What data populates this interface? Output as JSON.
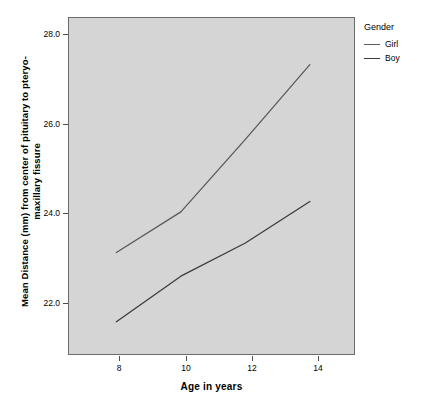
{
  "chart_data": {
    "type": "line",
    "title": "",
    "xlabel": "Age in years",
    "ylabel": "Mean Distance (mm) from center of pituitary to pteryo-maxillary fissure",
    "ylabel_line1": "Mean Distance (mm) from center of pituitary to pteryo-",
    "ylabel_line2": "maxillary fissure",
    "x": [
      8,
      10,
      12,
      14
    ],
    "xtick_labels": [
      "8",
      "10",
      "12",
      "14"
    ],
    "ytick_labels": [
      "28.0",
      "26.0",
      "24.0",
      "22.0"
    ],
    "ytick_values": [
      28.0,
      26.0,
      24.0,
      22.0
    ],
    "xlim": [
      6.5,
      15.4
    ],
    "ylim": [
      20.4,
      28.55
    ],
    "grid": false,
    "legend_position": "right",
    "legend_title": "Gender",
    "series": [
      {
        "name": "Girl",
        "color": "#5a5a5a",
        "values": [
          22.87,
          23.85,
          25.6,
          27.4
        ]
      },
      {
        "name": "Boy",
        "color": "#3c3c3c",
        "values": [
          21.2,
          22.3,
          23.1,
          24.1
        ]
      }
    ],
    "panel_background": "#d5d5d5",
    "panel_border": "#6b6b6b"
  },
  "axes": {
    "x_title": "Age in years",
    "y_title_line1": "Mean Distance (mm) from center of pituitary to pteryo-",
    "y_title_line2": "maxillary fissure",
    "y_ticks": [
      {
        "label": "28.0"
      },
      {
        "label": "26.0"
      },
      {
        "label": "24.0"
      },
      {
        "label": "22.0"
      }
    ],
    "x_ticks": [
      {
        "label": "8"
      },
      {
        "label": "10"
      },
      {
        "label": "12"
      },
      {
        "label": "14"
      }
    ]
  },
  "legend": {
    "title": "Gender",
    "items": [
      {
        "label": "Girl",
        "color": "#5a5a5a"
      },
      {
        "label": "Boy",
        "color": "#3c3c3c"
      }
    ]
  }
}
